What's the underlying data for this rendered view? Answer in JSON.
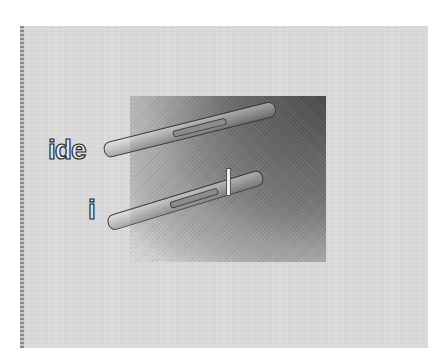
{
  "figure": {
    "labels": {
      "upper": "ide",
      "lower": "i"
    },
    "colors": {
      "background": "#d9d9d9",
      "dark_region": "#4a4a4a",
      "label_fill": "#e6e6e6",
      "label_outline": "#2a2a2a"
    }
  }
}
